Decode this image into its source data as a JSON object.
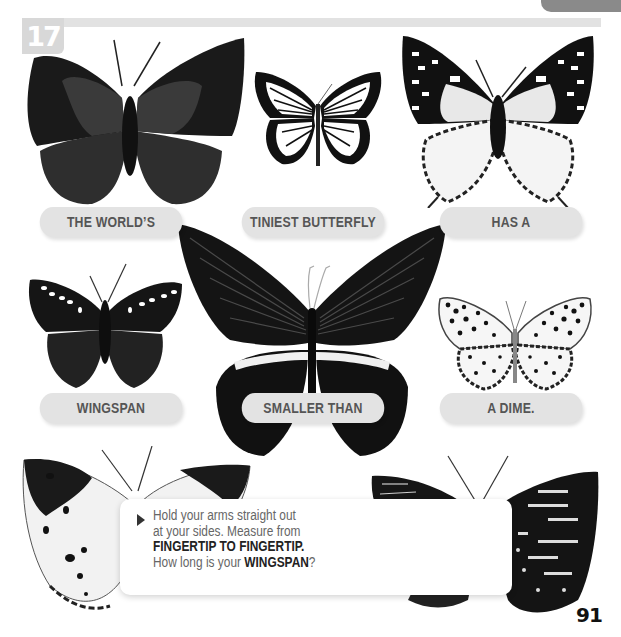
{
  "page": {
    "fact_number": "17",
    "page_number": "91"
  },
  "labels": [
    {
      "id": "pill-1",
      "text": "THE WORLD’S"
    },
    {
      "id": "pill-2",
      "text": "TINIEST BUTTERFLY"
    },
    {
      "id": "pill-3",
      "text": "HAS A"
    },
    {
      "id": "pill-4",
      "text": "WINGSPAN"
    },
    {
      "id": "pill-5",
      "text": "SMALLER THAN"
    },
    {
      "id": "pill-6",
      "text": "A DIME."
    }
  ],
  "callout": {
    "arrow_icon": "triangle-right-icon",
    "line1": "Hold your arms straight out",
    "line2": "at your sides. Measure from",
    "line3_bold": "FINGERTIP TO FINGERTIP.",
    "line4_prefix": "How long is your ",
    "line4_bold": "WINGSPAN",
    "line4_suffix": "?"
  },
  "images": [
    {
      "name": "butterfly-dark-leafwing",
      "position": "top-left"
    },
    {
      "name": "butterfly-white-veined",
      "position": "top-center"
    },
    {
      "name": "butterfly-spotted-charaxes",
      "position": "top-right"
    },
    {
      "name": "butterfly-dark-spotted",
      "position": "middle-left"
    },
    {
      "name": "butterfly-great-mormon-swallowtail",
      "position": "center"
    },
    {
      "name": "butterfly-leopard-spotted",
      "position": "middle-right"
    },
    {
      "name": "butterfly-white-black-tip",
      "position": "bottom-left"
    },
    {
      "name": "butterfly-dark-patterned",
      "position": "bottom-right"
    }
  ],
  "colors": {
    "pill_bg": "#e3e3e3",
    "pill_text": "#555555",
    "header_bar": "#e2e2e2",
    "badge_bg": "#d8d8d8",
    "corner_tab": "#8a8a8a"
  }
}
